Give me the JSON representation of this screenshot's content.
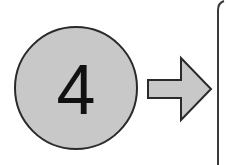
{
  "step": {
    "number": "4",
    "fill": "#c8c8c8",
    "stroke": "#2a2a2a"
  },
  "arrow": {
    "direction": "right",
    "fill": "#c8c8c8",
    "stroke": "#2a2a2a"
  },
  "panel": {
    "stroke": "#3a3a3a"
  }
}
